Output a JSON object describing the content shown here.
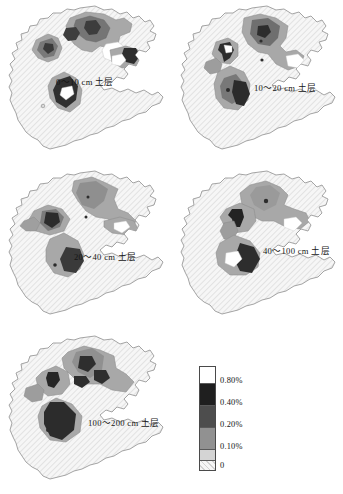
{
  "figure": {
    "type": "choropleth-map-series",
    "units": "%"
  },
  "panels": [
    {
      "id": "panel-0-10",
      "label": "0～10 cm 土层",
      "depth_min_cm": 0,
      "depth_max_cm": 10,
      "label_x": 78,
      "label_y": 84
    },
    {
      "id": "panel-10-20",
      "label": "10～20 cm 土层",
      "depth_min_cm": 10,
      "depth_max_cm": 20,
      "label_x": 254,
      "label_y": 90
    },
    {
      "id": "panel-20-40",
      "label": "20～40 cm 土层",
      "depth_min_cm": 20,
      "depth_max_cm": 40,
      "label_x": 72,
      "label_y": 257
    },
    {
      "id": "panel-40-100",
      "label": "40～100 cm 土层",
      "depth_min_cm": 40,
      "depth_max_cm": 100,
      "label_x": 263,
      "label_y": 255
    },
    {
      "id": "panel-100-200",
      "label": "100～200 cm 土层",
      "depth_min_cm": 100,
      "depth_max_cm": 200,
      "label_x": 88,
      "label_y": 419
    }
  ],
  "legend": {
    "name": "legend",
    "ticks": [
      "0.80%",
      "0.40%",
      "0.20%",
      "0.10%",
      "0"
    ],
    "classes": [
      {
        "label": "0.80%",
        "range": "> 0.80%",
        "color": "#ffffff",
        "height": 16
      },
      {
        "label": "0.40%",
        "range": "0.40% – 0.80%",
        "color": "#1f1f1f",
        "height": 22
      },
      {
        "label": "0.20%",
        "range": "0.20% – 0.40%",
        "color": "#4a4a4a",
        "height": 22
      },
      {
        "label": "0.10%",
        "range": "0.10% – 0.20%",
        "color": "#8f8f8f",
        "height": 22
      },
      {
        "label": "0",
        "range": "0 – 0.10%",
        "color": "#d6d6d6",
        "height": 11
      },
      {
        "label": "",
        "range": "0 (hatched)",
        "color": "#f2f2f2",
        "height": 12
      }
    ],
    "tick_offsets": [
      14,
      36,
      58,
      80,
      99
    ]
  },
  "colors": {
    "outline": "#8c8c8c",
    "base_hatch_fill": "#f4f4f4",
    "hatch_line": "#cfcfcf",
    "class_light": "#d9d9d9",
    "class_mid": "#a3a3a3",
    "class_dark": "#6e6e6e",
    "class_darkest": "#2a2a2a",
    "class_white": "#ffffff",
    "text": "#151515"
  }
}
